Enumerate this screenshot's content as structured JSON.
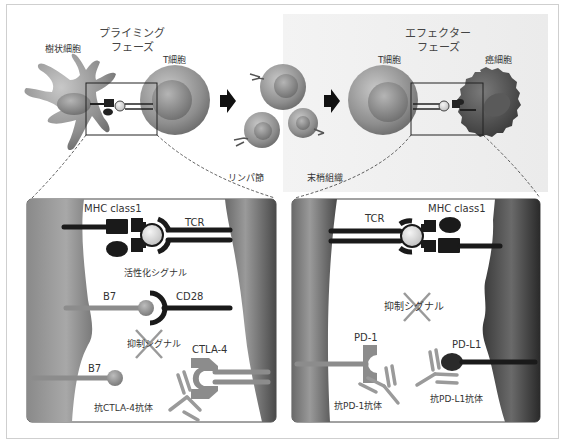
{
  "priming_phase": {
    "title_line1": "プライミング",
    "title_line2": "フェーズ",
    "dendritic_cell_label": "樹状細胞",
    "t_cell_label": "T細胞"
  },
  "lymph_node": {
    "label": "リンパ節"
  },
  "peripheral_tissue": {
    "label": "末梢組織"
  },
  "effector_phase": {
    "title_line1": "エフェクター",
    "title_line2": "フェーズ",
    "t_cell_label": "T細胞",
    "cancer_cell_label": "癌細胞"
  },
  "left_detail_panel": {
    "mhc_label": "MHC class1",
    "tcr_label": "TCR",
    "activation_signal_label": "活性化シグナル",
    "b7_label_1": "B7",
    "cd28_label": "CD28",
    "inhibitory_signal_label": "抑制シグナル",
    "ctla4_label": "CTLA-4",
    "b7_label_2": "B7",
    "anti_ctla4_label": "抗CTLA-4抗体"
  },
  "right_detail_panel": {
    "tcr_label": "TCR",
    "mhc_label": "MHC class1",
    "inhibitory_signal_label": "抑制シグナル",
    "pd1_label": "PD-1",
    "pdl1_label": "PD-L1",
    "anti_pd1_label": "抗PD-1抗体",
    "anti_pdl1_label": "抗PD-L1抗体"
  },
  "colors": {
    "cell_gray": "#8a8a8a",
    "cancer_dark": "#4a4a4a",
    "receptor_black": "#1a1a1a",
    "ligand_gray": "#8c8c8c",
    "frame_border": "#cfcfcf"
  }
}
